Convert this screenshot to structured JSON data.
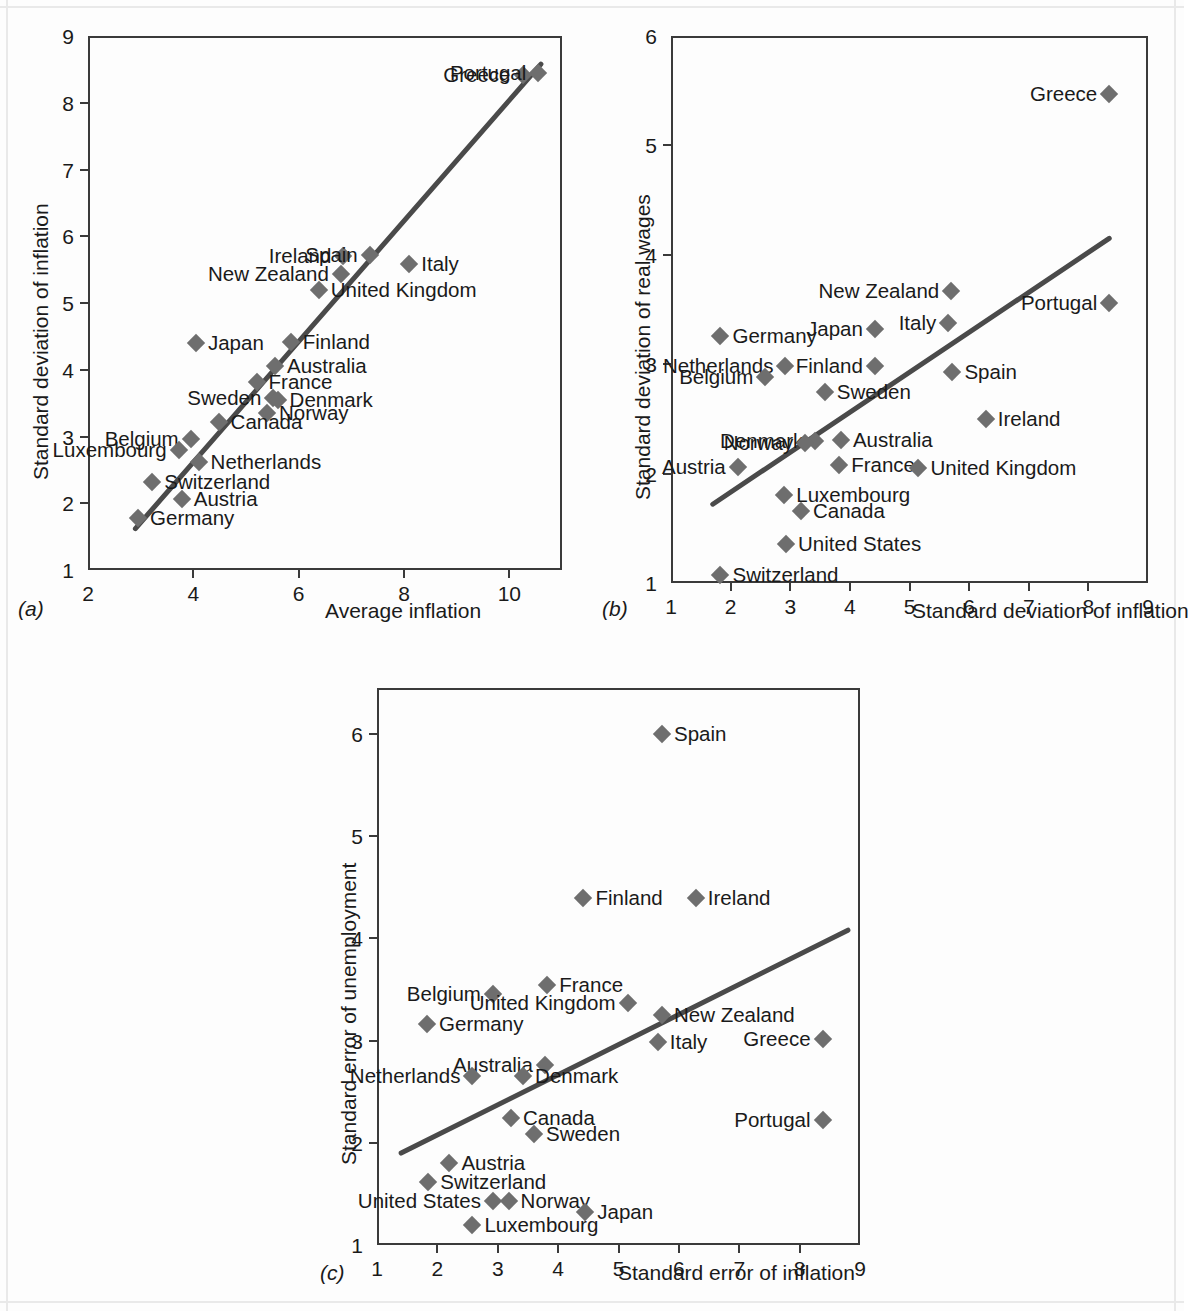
{
  "chart_data": [
    {
      "type": "scatter",
      "panel": "a",
      "panel_letter": "(a)",
      "title": "",
      "xlabel": "Average inflation",
      "ylabel": "Standard deviation of inflation",
      "xlim": [
        2,
        11
      ],
      "ylim": [
        1,
        9
      ],
      "xticks": [
        2,
        4,
        6,
        8,
        10
      ],
      "yticks": [
        1,
        2,
        3,
        4,
        5,
        6,
        7,
        8,
        9
      ],
      "grid": false,
      "legend": "none",
      "trendline": {
        "x0": 2.9,
        "y0": 1.62,
        "x1": 10.6,
        "y1": 8.58
      },
      "points": [
        {
          "label": "Greece",
          "x": 10.25,
          "y": 8.42,
          "label_pos": "left"
        },
        {
          "label": "Portugal",
          "x": 10.55,
          "y": 8.45,
          "label_pos": "left"
        },
        {
          "label": "Ireland",
          "x": 6.85,
          "y": 5.7,
          "label_pos": "left"
        },
        {
          "label": "Spain",
          "x": 7.35,
          "y": 5.72,
          "label_pos": "left"
        },
        {
          "label": "Italy",
          "x": 8.1,
          "y": 5.58,
          "label_pos": "right"
        },
        {
          "label": "New Zealand",
          "x": 6.8,
          "y": 5.44,
          "label_pos": "left"
        },
        {
          "label": "United Kingdom",
          "x": 6.38,
          "y": 5.2,
          "label_pos": "right"
        },
        {
          "label": "Japan",
          "x": 4.05,
          "y": 4.4,
          "label_pos": "right"
        },
        {
          "label": "Finland",
          "x": 5.85,
          "y": 4.42,
          "label_pos": "right"
        },
        {
          "label": "Australia",
          "x": 5.55,
          "y": 4.06,
          "label_pos": "right"
        },
        {
          "label": "France",
          "x": 5.2,
          "y": 3.82,
          "label_pos": "right"
        },
        {
          "label": "Sweden",
          "x": 5.52,
          "y": 3.58,
          "label_pos": "left"
        },
        {
          "label": "Denmark",
          "x": 5.6,
          "y": 3.54,
          "label_pos": "right"
        },
        {
          "label": "Norway",
          "x": 5.4,
          "y": 3.35,
          "label_pos": "right"
        },
        {
          "label": "Canada",
          "x": 4.48,
          "y": 3.22,
          "label_pos": "right"
        },
        {
          "label": "Belgium",
          "x": 3.95,
          "y": 2.96,
          "label_pos": "left"
        },
        {
          "label": "Luxembourg",
          "x": 3.72,
          "y": 2.8,
          "label_pos": "left"
        },
        {
          "label": "Netherlands",
          "x": 4.1,
          "y": 2.62,
          "label_pos": "right"
        },
        {
          "label": "Switzerland",
          "x": 3.22,
          "y": 2.32,
          "label_pos": "right"
        },
        {
          "label": "Austria",
          "x": 3.78,
          "y": 2.06,
          "label_pos": "right"
        },
        {
          "label": "Germany",
          "x": 2.95,
          "y": 1.78,
          "label_pos": "right"
        }
      ]
    },
    {
      "type": "scatter",
      "panel": "b",
      "panel_letter": "(b)",
      "title": "",
      "xlabel": "Standard deviation of inflation",
      "ylabel": "Standard deviation of real wages",
      "xlim": [
        1,
        9
      ],
      "ylim": [
        1,
        6
      ],
      "xticks": [
        1,
        2,
        3,
        4,
        5,
        6,
        7,
        8,
        9
      ],
      "yticks": [
        1,
        2,
        3,
        4,
        5,
        6
      ],
      "grid": false,
      "legend": "none",
      "trendline": {
        "x0": 1.7,
        "y0": 1.72,
        "x1": 8.35,
        "y1": 4.15
      },
      "points": [
        {
          "label": "Greece",
          "x": 8.35,
          "y": 5.47,
          "label_pos": "left"
        },
        {
          "label": "New Zealand",
          "x": 5.7,
          "y": 3.67,
          "label_pos": "left"
        },
        {
          "label": "Portugal",
          "x": 8.35,
          "y": 3.56,
          "label_pos": "left"
        },
        {
          "label": "Italy",
          "x": 5.65,
          "y": 3.38,
          "label_pos": "left"
        },
        {
          "label": "Japan",
          "x": 4.42,
          "y": 3.32,
          "label_pos": "left"
        },
        {
          "label": "Germany",
          "x": 1.83,
          "y": 3.26,
          "label_pos": "right"
        },
        {
          "label": "Netherlands",
          "x": 2.92,
          "y": 2.98,
          "label_pos": "left"
        },
        {
          "label": "Finland",
          "x": 4.42,
          "y": 2.98,
          "label_pos": "left"
        },
        {
          "label": "Spain",
          "x": 5.72,
          "y": 2.93,
          "label_pos": "right"
        },
        {
          "label": "Belgium",
          "x": 2.58,
          "y": 2.88,
          "label_pos": "left"
        },
        {
          "label": "Sweden",
          "x": 3.58,
          "y": 2.75,
          "label_pos": "right"
        },
        {
          "label": "Ireland",
          "x": 6.28,
          "y": 2.5,
          "label_pos": "right"
        },
        {
          "label": "Denmark",
          "x": 3.42,
          "y": 2.3,
          "label_pos": "left"
        },
        {
          "label": "Norway",
          "x": 3.25,
          "y": 2.28,
          "label_pos": "left"
        },
        {
          "label": "Australia",
          "x": 3.85,
          "y": 2.31,
          "label_pos": "right"
        },
        {
          "label": "Austria",
          "x": 2.12,
          "y": 2.06,
          "label_pos": "left"
        },
        {
          "label": "France",
          "x": 3.82,
          "y": 2.08,
          "label_pos": "right"
        },
        {
          "label": "United Kingdom",
          "x": 5.15,
          "y": 2.05,
          "label_pos": "right"
        },
        {
          "label": "Luxembourg",
          "x": 2.9,
          "y": 1.8,
          "label_pos": "right"
        },
        {
          "label": "Canada",
          "x": 3.18,
          "y": 1.66,
          "label_pos": "right"
        },
        {
          "label": "United States",
          "x": 2.93,
          "y": 1.36,
          "label_pos": "right"
        },
        {
          "label": "Switzerland",
          "x": 1.83,
          "y": 1.07,
          "label_pos": "right"
        }
      ]
    },
    {
      "type": "scatter",
      "panel": "c",
      "panel_letter": "(c)",
      "title": "",
      "xlabel": "Standard error of inflation",
      "ylabel": "Standard error of unemployment",
      "xlim": [
        1,
        9
      ],
      "ylim": [
        1,
        6.45
      ],
      "xticks": [
        1,
        2,
        3,
        4,
        5,
        6,
        7,
        8,
        9
      ],
      "yticks": [
        1,
        2,
        3,
        4,
        5,
        6
      ],
      "grid": false,
      "legend": "none",
      "trendline": {
        "x0": 1.4,
        "y0": 1.9,
        "x1": 8.8,
        "y1": 4.08
      },
      "points": [
        {
          "label": "Spain",
          "x": 5.72,
          "y": 6.0,
          "label_pos": "right"
        },
        {
          "label": "Finland",
          "x": 4.42,
          "y": 4.4,
          "label_pos": "right"
        },
        {
          "label": "Ireland",
          "x": 6.28,
          "y": 4.4,
          "label_pos": "right"
        },
        {
          "label": "France",
          "x": 3.82,
          "y": 3.54,
          "label_pos": "right"
        },
        {
          "label": "Belgium",
          "x": 2.92,
          "y": 3.46,
          "label_pos": "left"
        },
        {
          "label": "United Kingdom",
          "x": 5.15,
          "y": 3.37,
          "label_pos": "left"
        },
        {
          "label": "New Zealand",
          "x": 5.72,
          "y": 3.25,
          "label_pos": "right"
        },
        {
          "label": "Germany",
          "x": 1.83,
          "y": 3.16,
          "label_pos": "right"
        },
        {
          "label": "Greece",
          "x": 8.38,
          "y": 3.02,
          "label_pos": "left"
        },
        {
          "label": "Italy",
          "x": 5.65,
          "y": 2.99,
          "label_pos": "right"
        },
        {
          "label": "Australia",
          "x": 3.78,
          "y": 2.76,
          "label_pos": "left"
        },
        {
          "label": "Netherlands",
          "x": 2.58,
          "y": 2.65,
          "label_pos": "left"
        },
        {
          "label": "Denmark",
          "x": 3.42,
          "y": 2.65,
          "label_pos": "right"
        },
        {
          "label": "Canada",
          "x": 3.22,
          "y": 2.24,
          "label_pos": "right"
        },
        {
          "label": "Portugal",
          "x": 8.38,
          "y": 2.22,
          "label_pos": "left"
        },
        {
          "label": "Sweden",
          "x": 3.6,
          "y": 2.09,
          "label_pos": "right"
        },
        {
          "label": "Austria",
          "x": 2.2,
          "y": 1.8,
          "label_pos": "right"
        },
        {
          "label": "Switzerland",
          "x": 1.85,
          "y": 1.62,
          "label_pos": "right"
        },
        {
          "label": "United States",
          "x": 2.92,
          "y": 1.43,
          "label_pos": "left"
        },
        {
          "label": "Norway",
          "x": 3.18,
          "y": 1.43,
          "label_pos": "right"
        },
        {
          "label": "Japan",
          "x": 4.45,
          "y": 1.32,
          "label_pos": "right"
        },
        {
          "label": "Luxembourg",
          "x": 2.58,
          "y": 1.2,
          "label_pos": "right"
        }
      ]
    }
  ]
}
